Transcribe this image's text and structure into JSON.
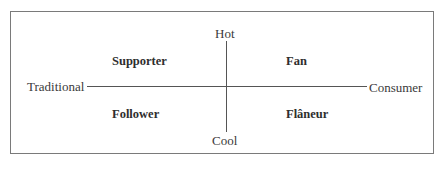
{
  "diagram": {
    "axes": {
      "top": "Hot",
      "bottom": "Cool",
      "left": "Traditional",
      "right": "Consumer"
    },
    "quadrants": {
      "top_left": "Supporter",
      "top_right": "Fan",
      "bottom_left": "Follower",
      "bottom_right": "Flâneur"
    }
  }
}
